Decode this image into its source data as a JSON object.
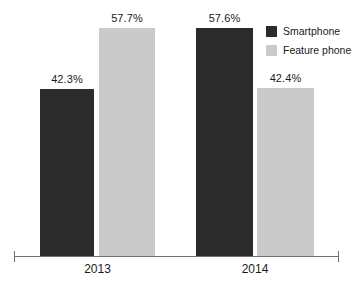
{
  "chart_data": {
    "type": "bar",
    "title": "",
    "subtitle": "",
    "xlabel": "",
    "ylabel": "",
    "categories": [
      "2013",
      "2014"
    ],
    "ylim": [
      0,
      63
    ],
    "grid": false,
    "legend_position": "top-right",
    "series": [
      {
        "name": "Smartphone",
        "color": "#2b2b2b",
        "values": [
          42.3,
          57.6
        ],
        "labels": [
          "42.3%",
          "57.6%"
        ]
      },
      {
        "name": "Feature phone",
        "color": "#cacaca",
        "values": [
          57.7,
          42.4
        ],
        "labels": [
          "57.7%",
          "42.4%"
        ]
      }
    ]
  },
  "legend": {
    "items": [
      {
        "label": "Smartphone",
        "swatch": "#2b2b2b"
      },
      {
        "label": "Feature phone",
        "swatch": "#cacaca"
      }
    ]
  },
  "axis": {
    "category_labels": [
      "2013",
      "2014"
    ]
  },
  "bars": [
    {
      "group": "2013",
      "series": "Smartphone",
      "label": "42.3%"
    },
    {
      "group": "2013",
      "series": "Feature phone",
      "label": "57.7%"
    },
    {
      "group": "2014",
      "series": "Smartphone",
      "label": "57.6%"
    },
    {
      "group": "2014",
      "series": "Feature phone",
      "label": "42.4%"
    }
  ]
}
